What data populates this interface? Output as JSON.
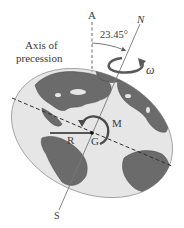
{
  "diagram": {
    "labels": {
      "axis_a": "A",
      "axis_n": "N",
      "axis_s": "S",
      "angle": "23.45°",
      "precession_line1": "Axis of",
      "precession_line2": "precession",
      "omega": "ω",
      "moment": "M",
      "radius": "R",
      "center": "G"
    },
    "colors": {
      "background": "#ffffff",
      "ocean": "#e6e6e6",
      "land": "#6b6b6b",
      "land_edge": "#4a4a4a",
      "axis_line": "#555555",
      "arrow": "#5a5a5a",
      "text": "#3a3a3a"
    },
    "geometry": {
      "axis_tilt_deg": 23.45,
      "globe_center": [
        92,
        133
      ]
    }
  }
}
